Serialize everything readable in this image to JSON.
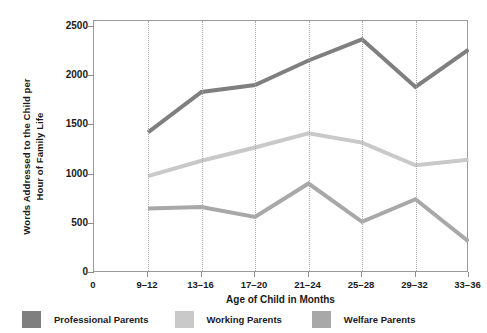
{
  "chart_data": {
    "type": "line",
    "title": "",
    "xlabel": "Age of Child in Months",
    "ylabel_line1": "Words Addressed to the Child per",
    "ylabel_line2": "Hour of Family Life",
    "categories": [
      "9–12",
      "13–16",
      "17–20",
      "21–24",
      "25–28",
      "29–32",
      "33–36"
    ],
    "x_origin_label": "0",
    "ytick_labels": [
      "2500",
      "2000",
      "1500",
      "1000",
      "500",
      "0"
    ],
    "ytick_values": [
      2500,
      2000,
      1500,
      1000,
      500,
      0
    ],
    "ylim": [
      0,
      2500
    ],
    "grid": "vertical-dotted",
    "legend_position": "bottom",
    "series": [
      {
        "name": "Professional Parents",
        "color": "#7f7f7f",
        "values": [
          1430,
          1840,
          1910,
          2160,
          2375,
          1890,
          2270
        ]
      },
      {
        "name": "Working Parents",
        "color": "#c9c9c9",
        "values": [
          985,
          1140,
          1275,
          1420,
          1325,
          1095,
          1150
        ]
      },
      {
        "name": "Welfare Parents",
        "color": "#a8a8a8",
        "values": [
          655,
          670,
          570,
          910,
          520,
          750,
          320
        ]
      }
    ]
  },
  "axis": {
    "frame_color": "#9a9a9a",
    "grid_color": "#a9a9a9"
  }
}
